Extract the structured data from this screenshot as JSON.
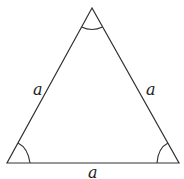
{
  "diagram": {
    "type": "equilateral-triangle",
    "vertices": {
      "top": [
        92,
        8
      ],
      "bottom_left": [
        7,
        163
      ],
      "bottom_right": [
        179,
        163
      ]
    },
    "side_labels": {
      "left": "a",
      "right": "a",
      "bottom": "a"
    },
    "angle_marks": [
      "top",
      "bottom-left",
      "bottom-right"
    ],
    "colors": {
      "stroke": "#333333",
      "background": "#ffffff"
    }
  }
}
